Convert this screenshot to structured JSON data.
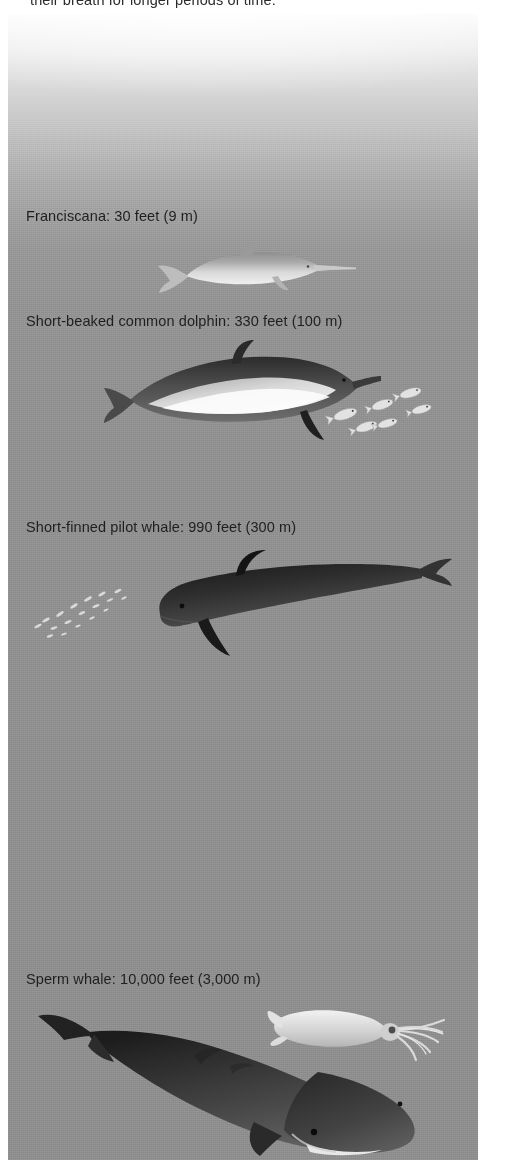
{
  "page": {
    "background_top_color": "#fbfbfb",
    "background_bottom_color": "#8d8d8d",
    "text_color": "#1f1f1f"
  },
  "top_caption": {
    "text": "their breath for longer periods of time."
  },
  "tiers": [
    {
      "id": "franciscana",
      "label": "Franciscana: 30 feet (9 m)",
      "species": "Franciscana",
      "depth_feet": 30,
      "depth_meters": 9,
      "animal_icon": "franciscana-dolphin-illustration"
    },
    {
      "id": "common",
      "label": "Short-beaked common dolphin: 330 feet (100 m)",
      "species": "Short-beaked common dolphin",
      "depth_feet": 330,
      "depth_meters": 100,
      "animal_icon": "common-dolphin-illustration",
      "prey_icon": "fish-school-illustration",
      "prey_count": 6
    },
    {
      "id": "pilot",
      "label": "Short-finned pilot whale: 990 feet (300 m)",
      "species": "Short-finned pilot whale",
      "depth_feet": 990,
      "depth_meters": 300,
      "animal_icon": "pilot-whale-illustration",
      "prey_icon": "krill-swarm-illustration"
    },
    {
      "id": "sperm",
      "label": "Sperm whale: 10,000 feet (3,000 m)",
      "species": "Sperm whale",
      "depth_feet": 10000,
      "depth_meters": 3000,
      "animal_icon": "sperm-whale-illustration",
      "prey_icon": "squid-illustration"
    }
  ]
}
